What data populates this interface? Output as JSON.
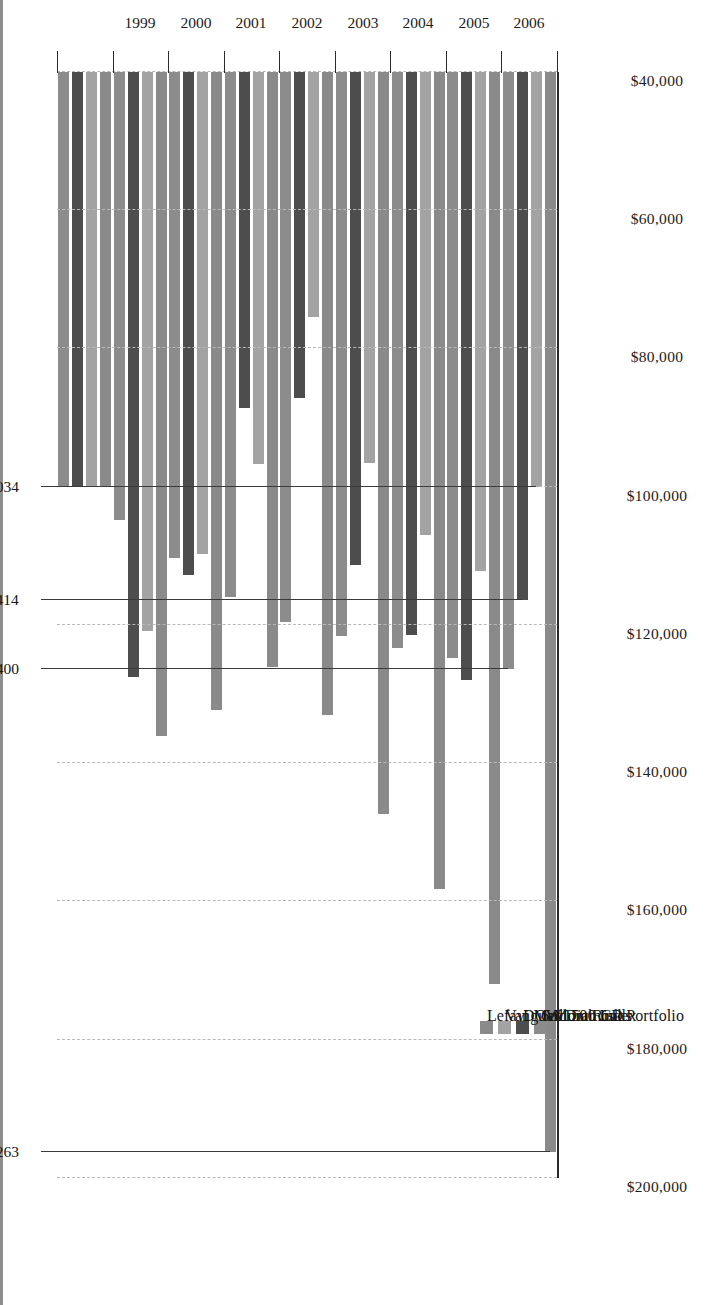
{
  "chart_data": {
    "type": "bar",
    "orientation": "horizontal",
    "title": "",
    "subtitle": "",
    "xlabel": "",
    "ylabel": "",
    "categories": [
      "1998",
      "1999",
      "2000",
      "2001",
      "2002",
      "2003",
      "2004",
      "2005",
      "2006"
    ],
    "category_tick_labels": [
      "",
      "1999",
      "2000",
      "2001",
      "2002",
      "2003",
      "2004",
      "2005",
      "2006"
    ],
    "value_axis": {
      "min": 40000,
      "max": 200000,
      "step": 20000,
      "tick_labels": [
        "$200,000",
        "$180,000",
        "$160,000",
        "$140,000",
        "$120,000",
        "$100,000",
        "$80,000",
        "$60,000",
        "$40,000"
      ],
      "tick_values": [
        200000,
        180000,
        160000,
        140000,
        120000,
        100000,
        80000,
        60000,
        40000
      ],
      "grid": true,
      "reversed": true
    },
    "series": [
      {
        "name": "6 Month CD",
        "color": "#8c8c8c",
        "values": [
          100000,
          104800,
          110300,
          116000,
          119500,
          121600,
          123400,
          124800,
          126400
        ]
      },
      {
        "name": "DOW Diamonds",
        "color": "#4d4d4d",
        "values": [
          100000,
          127500,
          112700,
          88600,
          87200,
          111300,
          121400,
          127900,
          116414
        ]
      },
      {
        "name": "Vanguard 500 Index",
        "color": "#a3a3a3",
        "values": [
          100000,
          120800,
          109700,
          96700,
          75400,
          96600,
          107000,
          112200,
          100034
        ]
      },
      {
        "name": "Lefavi Medium Risk Portfolio",
        "color": "#8a8a8a",
        "values": [
          100000,
          136000,
          132300,
          126100,
          133000,
          147400,
          158200,
          172000,
          196263
        ]
      }
    ],
    "annotations": [
      {
        "label": "$196,263",
        "series": "Lefavi Medium Risk Portfolio",
        "category": "2006",
        "value": 196263
      },
      {
        "label": "$126,400",
        "series": "6 Month CD",
        "category": "2006",
        "value": 126400
      },
      {
        "label": "$116,414",
        "series": "DOW Diamonds",
        "category": "2006",
        "value": 116414
      },
      {
        "label": "$100,034",
        "series": "Vanguard 500 Index",
        "category": "2006",
        "value": 100034
      }
    ],
    "legend": {
      "position": "inside-bottom-left",
      "entries": [
        {
          "label": "6 Month CD",
          "color": "#8c8c8c"
        },
        {
          "label": "DOW Diamonds",
          "color": "#4d4d4d"
        },
        {
          "label": "Vanguard 500 Index",
          "color": "#a3a3a3"
        },
        {
          "label": "Lefavi Medium Risk Portfolio",
          "color": "#8a8a8a"
        }
      ]
    }
  },
  "colors": {
    "axis": "#2a2a2a",
    "gridline": "#b9b9b9",
    "text": "#1b1b1b",
    "background": "#ffffff",
    "scan_edge": "#8e8e8e"
  }
}
